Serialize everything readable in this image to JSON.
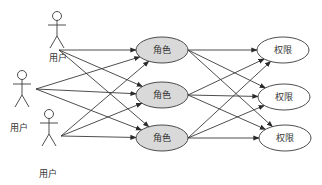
{
  "diagram": {
    "type": "RBAC user-role-permission mapping",
    "colors": {
      "stroke": "#3a3a3a",
      "role_fill": "#d9d9d9",
      "permission_fill": "#ffffff",
      "background": "#ffffff"
    },
    "users": [
      {
        "label": "用户",
        "head": [
          57,
          16
        ],
        "port": [
          59,
          50
        ],
        "label_pos": [
          58,
          58
        ]
      },
      {
        "label": "用户",
        "head": [
          22,
          75
        ],
        "port": [
          36,
          89
        ],
        "label_pos": [
          19,
          128
        ]
      },
      {
        "label": "用户",
        "head": [
          49,
          114
        ],
        "port": [
          61,
          136
        ],
        "label_pos": [
          48,
          174
        ]
      }
    ],
    "roles": [
      {
        "label": "角色",
        "cx": 162,
        "cy": 50,
        "rx": 26,
        "ry": 13
      },
      {
        "label": "角色",
        "cx": 162,
        "cy": 95,
        "rx": 26,
        "ry": 13
      },
      {
        "label": "角色",
        "cx": 162,
        "cy": 138,
        "rx": 26,
        "ry": 13
      }
    ],
    "permissions": [
      {
        "label": "权限",
        "cx": 283,
        "cy": 50,
        "rx": 26,
        "ry": 13
      },
      {
        "label": "权限",
        "cx": 284,
        "cy": 97,
        "rx": 26,
        "ry": 13
      },
      {
        "label": "权限",
        "cx": 285,
        "cy": 138,
        "rx": 26,
        "ry": 13
      }
    ],
    "edges_note": "Every user connects to every role (arrows), every role connects to every permission (arrows)"
  }
}
